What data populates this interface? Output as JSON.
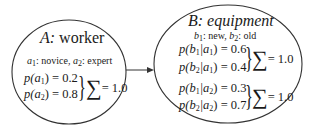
{
  "node_a": {
    "label_var": "A:",
    "label_name": "worker",
    "values_desc": {
      "a1": "a",
      "a1_sub": "1",
      "a1_text": ": novice, ",
      "a2": "a",
      "a2_sub": "2",
      "a2_text": ": expert"
    },
    "probs": [
      {
        "lhs": "p(a",
        "sub": "1",
        "rhs": ") = 0.2"
      },
      {
        "lhs": "p(a",
        "sub": "2",
        "rhs": ") = 0.8"
      }
    ],
    "sum_label": "= 1.0",
    "sum_symbol": "∑"
  },
  "node_b": {
    "label_var": "B:",
    "label_name": "equipment",
    "values_desc": {
      "b1": "b",
      "b1_sub": "1",
      "b1_text": ": new, ",
      "b2": "b",
      "b2_sub": "2",
      "b2_text": ": old"
    },
    "probs": [
      {
        "p": "p(b",
        "s1": "1",
        "mid": "|a",
        "s2": "1",
        "rhs": ") = 0.6"
      },
      {
        "p": "p(b",
        "s1": "2",
        "mid": "|a",
        "s2": "1",
        "rhs": ") = 0.4"
      },
      {
        "p": "p(b",
        "s1": "1",
        "mid": "|a",
        "s2": "2",
        "rhs": ") = 0.3"
      },
      {
        "p": "p(b",
        "s1": "2",
        "mid": "|a",
        "s2": "2",
        "rhs": ") = 0.7"
      }
    ],
    "sum_labels": [
      "= 1.0",
      "= 1.0"
    ],
    "sum_symbol": "∑"
  },
  "edge": {
    "from": "A",
    "to": "B"
  },
  "brace_symbol": "}"
}
